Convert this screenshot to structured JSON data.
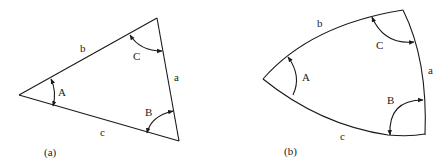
{
  "figure_a": {
    "caption": "(a)",
    "sides": {
      "a": "a",
      "b": "b",
      "c": "c"
    },
    "angles": {
      "A": "A",
      "B": "B",
      "C": "C"
    },
    "type": "plane triangle"
  },
  "figure_b": {
    "caption": "(b)",
    "sides": {
      "a": "a",
      "b": "b",
      "c": "c"
    },
    "angles": {
      "A": "A",
      "B": "B",
      "C": "C"
    },
    "type": "spherical triangle"
  },
  "colors": {
    "stroke": "#1a1a1a",
    "text": "#222222",
    "background": "#ffffff"
  }
}
